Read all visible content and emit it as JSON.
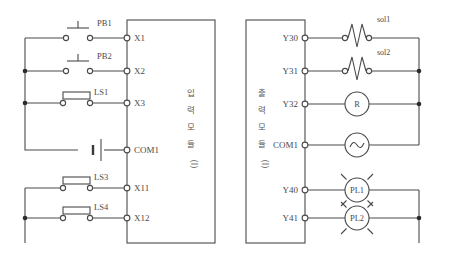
{
  "diagram": {
    "line_color": "#4a4a4a",
    "background": "#ffffff"
  },
  "input_module": {
    "name": "입력 모듈(I)",
    "label_chars": [
      "입",
      "력",
      "모",
      "듈",
      "(I)"
    ],
    "terminals": [
      {
        "id": "X1",
        "label": "X1",
        "y": 38
      },
      {
        "id": "X2",
        "label": "X2",
        "y": 71
      },
      {
        "id": "X3",
        "label": "X3",
        "y": 103
      },
      {
        "id": "COM1",
        "label": "COM1",
        "y": 144
      },
      {
        "id": "X11",
        "label": "X11",
        "y": 188
      },
      {
        "id": "X12",
        "label": "X12",
        "y": 218
      }
    ],
    "devices": [
      {
        "label": "PB1",
        "type": "pushbutton",
        "terminal": "X1"
      },
      {
        "label": "PB2",
        "type": "pushbutton",
        "terminal": "X2"
      },
      {
        "label": "LS1",
        "type": "limit-switch",
        "terminal": "X3"
      },
      {
        "label": "",
        "type": "dc-source",
        "terminal": "COM1"
      },
      {
        "label": "LS3",
        "type": "limit-switch",
        "terminal": "X11"
      },
      {
        "label": "LS4",
        "type": "limit-switch",
        "terminal": "X12"
      }
    ]
  },
  "output_module": {
    "name": "출력 모듈(I)",
    "label_chars": [
      "출",
      "력",
      "모",
      "듈",
      "(I)"
    ],
    "terminals": [
      {
        "id": "Y30",
        "label": "Y30",
        "y": 38
      },
      {
        "id": "Y31",
        "label": "Y31",
        "y": 71
      },
      {
        "id": "Y32",
        "label": "Y32",
        "y": 104
      },
      {
        "id": "COM1",
        "label": "COM1",
        "y": 145
      },
      {
        "id": "Y40",
        "label": "Y40",
        "y": 190
      },
      {
        "id": "Y41",
        "label": "Y41",
        "y": 218
      }
    ],
    "devices": [
      {
        "label": "sol1",
        "type": "solenoid",
        "terminal": "Y30"
      },
      {
        "label": "sol2",
        "type": "solenoid",
        "terminal": "Y31"
      },
      {
        "label": "R",
        "type": "relay",
        "terminal": "Y32"
      },
      {
        "label": "",
        "type": "ac-source",
        "terminal": "COM1"
      },
      {
        "label": "PL1",
        "type": "pilot-lamp",
        "terminal": "Y40"
      },
      {
        "label": "PL2",
        "type": "pilot-lamp",
        "terminal": "Y41"
      }
    ]
  }
}
